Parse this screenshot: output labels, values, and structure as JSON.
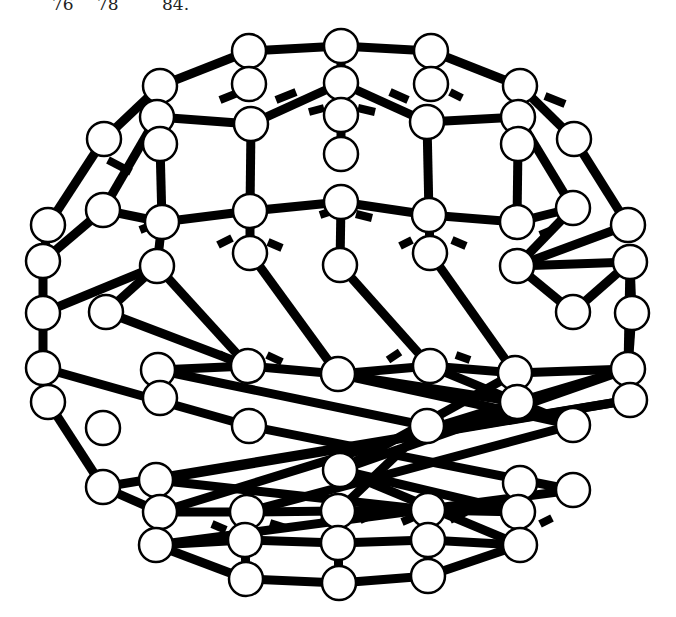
{
  "caption": {
    "fragments": [
      {
        "text": "76",
        "x": 52
      },
      {
        "text": "78",
        "x": 97
      },
      {
        "text": "84.",
        "x": 162
      }
    ]
  },
  "diagram": {
    "atom_radius": 17,
    "colors": {
      "bond": "#000000",
      "atom_fill": "#ffffff",
      "atom_stroke": "#000000"
    },
    "atoms": [
      [
        249,
        51
      ],
      [
        341,
        46
      ],
      [
        431,
        51
      ],
      [
        249,
        84
      ],
      [
        341,
        83
      ],
      [
        431,
        84
      ],
      [
        160,
        86
      ],
      [
        520,
        86
      ],
      [
        157,
        117
      ],
      [
        251,
        124
      ],
      [
        341,
        115
      ],
      [
        427,
        122
      ],
      [
        518,
        117
      ],
      [
        160,
        144
      ],
      [
        341,
        154
      ],
      [
        518,
        144
      ],
      [
        104,
        139
      ],
      [
        574,
        139
      ],
      [
        48,
        225
      ],
      [
        103,
        210
      ],
      [
        162,
        222
      ],
      [
        250,
        211
      ],
      [
        341,
        202
      ],
      [
        429,
        215
      ],
      [
        517,
        222
      ],
      [
        573,
        208
      ],
      [
        628,
        225
      ],
      [
        250,
        253
      ],
      [
        430,
        253
      ],
      [
        43,
        261
      ],
      [
        157,
        266
      ],
      [
        340,
        265
      ],
      [
        517,
        266
      ],
      [
        630,
        262
      ],
      [
        43,
        313
      ],
      [
        106,
        312
      ],
      [
        573,
        312
      ],
      [
        632,
        313
      ],
      [
        43,
        368
      ],
      [
        158,
        370
      ],
      [
        248,
        366
      ],
      [
        338,
        374
      ],
      [
        430,
        366
      ],
      [
        515,
        373
      ],
      [
        628,
        369
      ],
      [
        48,
        402
      ],
      [
        160,
        398
      ],
      [
        517,
        402
      ],
      [
        630,
        400
      ],
      [
        103,
        428
      ],
      [
        249,
        426
      ],
      [
        427,
        426
      ],
      [
        573,
        425
      ],
      [
        156,
        480
      ],
      [
        340,
        470
      ],
      [
        520,
        483
      ],
      [
        103,
        487
      ],
      [
        573,
        490
      ],
      [
        160,
        512
      ],
      [
        247,
        512
      ],
      [
        338,
        511
      ],
      [
        428,
        510
      ],
      [
        518,
        512
      ],
      [
        245,
        540
      ],
      [
        338,
        543
      ],
      [
        428,
        540
      ],
      [
        156,
        545
      ],
      [
        520,
        545
      ],
      [
        246,
        579
      ],
      [
        339,
        583
      ],
      [
        428,
        576
      ]
    ],
    "bonds": [
      [
        0,
        1
      ],
      [
        1,
        2
      ],
      [
        0,
        6
      ],
      [
        2,
        7
      ],
      [
        0,
        3
      ],
      [
        2,
        5
      ],
      [
        1,
        4
      ],
      [
        6,
        8
      ],
      [
        7,
        12
      ],
      [
        8,
        9
      ],
      [
        11,
        12
      ],
      [
        9,
        4
      ],
      [
        4,
        11
      ],
      [
        4,
        10
      ],
      [
        6,
        16
      ],
      [
        8,
        19
      ],
      [
        16,
        18
      ],
      [
        7,
        17
      ],
      [
        12,
        25
      ],
      [
        17,
        26
      ],
      [
        9,
        21
      ],
      [
        10,
        14
      ],
      [
        11,
        23
      ],
      [
        13,
        20
      ],
      [
        15,
        24
      ],
      [
        21,
        22
      ],
      [
        22,
        23
      ],
      [
        21,
        20
      ],
      [
        23,
        24
      ],
      [
        20,
        19
      ],
      [
        24,
        25
      ],
      [
        18,
        29
      ],
      [
        19,
        29
      ],
      [
        25,
        32
      ],
      [
        26,
        32
      ],
      [
        21,
        27
      ],
      [
        22,
        31
      ],
      [
        23,
        28
      ],
      [
        30,
        20
      ],
      [
        30,
        34
      ],
      [
        29,
        38
      ],
      [
        33,
        32
      ],
      [
        33,
        36
      ],
      [
        36,
        32
      ],
      [
        30,
        40
      ],
      [
        30,
        35
      ],
      [
        35,
        40
      ],
      [
        33,
        44
      ],
      [
        33,
        37
      ],
      [
        37,
        44
      ],
      [
        31,
        42
      ],
      [
        27,
        41
      ],
      [
        28,
        43
      ],
      [
        40,
        41
      ],
      [
        41,
        42
      ],
      [
        42,
        43
      ],
      [
        43,
        44
      ],
      [
        40,
        39
      ],
      [
        39,
        46
      ],
      [
        39,
        51
      ],
      [
        44,
        47
      ],
      [
        44,
        54
      ],
      [
        38,
        50
      ],
      [
        45,
        56
      ],
      [
        38,
        45
      ],
      [
        50,
        57
      ],
      [
        48,
        53
      ],
      [
        48,
        56
      ],
      [
        41,
        47
      ],
      [
        41,
        52
      ],
      [
        42,
        52
      ],
      [
        43,
        54
      ],
      [
        47,
        58
      ],
      [
        52,
        59
      ],
      [
        51,
        60
      ],
      [
        53,
        61
      ],
      [
        56,
        58
      ],
      [
        58,
        59
      ],
      [
        59,
        60
      ],
      [
        60,
        61
      ],
      [
        61,
        62
      ],
      [
        57,
        66
      ],
      [
        54,
        62
      ],
      [
        55,
        62
      ],
      [
        54,
        67
      ],
      [
        55,
        67
      ],
      [
        66,
        63
      ],
      [
        63,
        64
      ],
      [
        64,
        65
      ],
      [
        65,
        67
      ],
      [
        63,
        68
      ],
      [
        64,
        69
      ],
      [
        65,
        70
      ],
      [
        68,
        69
      ],
      [
        69,
        70
      ],
      [
        66,
        68
      ],
      [
        67,
        70
      ],
      [
        57,
        66
      ],
      [
        59,
        63
      ],
      [
        60,
        64
      ],
      [
        61,
        65
      ]
    ],
    "hidden_bond_stubs": [
      [
        [
          108,
          160
        ],
        [
          131,
          172
        ]
      ],
      [
        [
          220,
          100
        ],
        [
          240,
          92
        ]
      ],
      [
        [
          276,
          100
        ],
        [
          296,
          92
        ]
      ],
      [
        [
          309,
          112
        ],
        [
          324,
          108
        ]
      ],
      [
        [
          358,
          108
        ],
        [
          375,
          112
        ]
      ],
      [
        [
          390,
          92
        ],
        [
          408,
          100
        ]
      ],
      [
        [
          450,
          92
        ],
        [
          462,
          98
        ]
      ],
      [
        [
          545,
          96
        ],
        [
          565,
          104
        ]
      ],
      [
        [
          140,
          230
        ],
        [
          150,
          226
        ]
      ],
      [
        [
          218,
          245
        ],
        [
          232,
          238
        ]
      ],
      [
        [
          268,
          242
        ],
        [
          282,
          248
        ]
      ],
      [
        [
          320,
          215
        ],
        [
          335,
          210
        ]
      ],
      [
        [
          356,
          214
        ],
        [
          372,
          218
        ]
      ],
      [
        [
          400,
          246
        ],
        [
          412,
          240
        ]
      ],
      [
        [
          452,
          240
        ],
        [
          466,
          246
        ]
      ],
      [
        [
          540,
          235
        ],
        [
          552,
          230
        ]
      ],
      [
        [
          267,
          355
        ],
        [
          282,
          362
        ]
      ],
      [
        [
          219,
          354
        ],
        [
          230,
          360
        ]
      ],
      [
        [
          456,
          355
        ],
        [
          470,
          360
        ]
      ],
      [
        [
          388,
          360
        ],
        [
          400,
          352
        ]
      ],
      [
        [
          140,
          540
        ],
        [
          150,
          545
        ]
      ],
      [
        [
          212,
          524
        ],
        [
          226,
          530
        ]
      ],
      [
        [
          270,
          523
        ],
        [
          286,
          528
        ]
      ],
      [
        [
          320,
          520
        ],
        [
          334,
          524
        ]
      ],
      [
        [
          360,
          520
        ],
        [
          372,
          515
        ]
      ],
      [
        [
          402,
          522
        ],
        [
          416,
          516
        ]
      ],
      [
        [
          450,
          520
        ],
        [
          466,
          512
        ]
      ],
      [
        [
          540,
          524
        ],
        [
          552,
          518
        ]
      ]
    ]
  }
}
